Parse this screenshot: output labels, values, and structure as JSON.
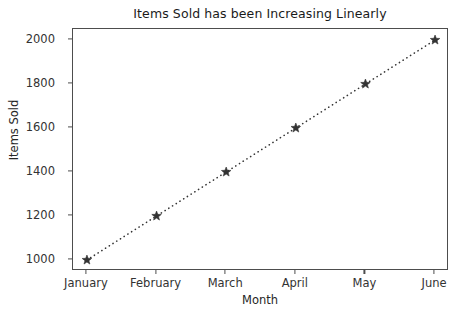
{
  "chart_data": {
    "type": "line",
    "title": "Items Sold has been Increasing Linearly",
    "xlabel": "Month",
    "ylabel": "Items Sold",
    "categories": [
      "January",
      "February",
      "March",
      "April",
      "May",
      "June"
    ],
    "values": [
      1000,
      1200,
      1400,
      1600,
      1800,
      2000
    ],
    "series": [
      {
        "name": "Items Sold",
        "values": [
          1000,
          1200,
          1400,
          1600,
          1800,
          2000
        ],
        "line_style": "dotted",
        "marker": "star",
        "color": "#333333"
      }
    ],
    "yticks": [
      1000,
      1200,
      1400,
      1600,
      1800,
      2000
    ],
    "ytick_labels": [
      "1000",
      "1200",
      "1400",
      "1600",
      "1800",
      "2000"
    ],
    "xtick_labels": [
      "January",
      "February",
      "March",
      "April",
      "May",
      "June"
    ],
    "ylim": [
      950,
      2050
    ],
    "xlim": [
      -0.2,
      5.2
    ],
    "grid": false,
    "legend": false,
    "legend_position": "none",
    "annotations": []
  },
  "style": {
    "background": "#ffffff",
    "axis_color": "#4d4d4d",
    "text_color": "#262626",
    "series_color": "#333333"
  }
}
